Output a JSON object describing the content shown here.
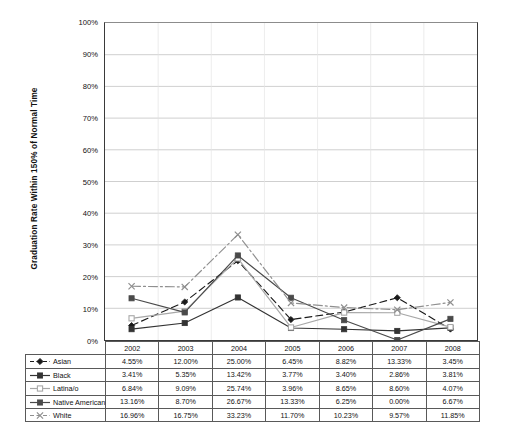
{
  "chart_data": {
    "type": "line",
    "title": "",
    "xlabel": "",
    "ylabel": "Graduation Rate Within 150% of Normal Time",
    "categories": [
      "2002",
      "2003",
      "2004",
      "2005",
      "2006",
      "2007",
      "2008"
    ],
    "ylim": [
      0,
      100
    ],
    "ytick_labels": [
      "0%",
      "10%",
      "20%",
      "30%",
      "40%",
      "50%",
      "60%",
      "70%",
      "80%",
      "90%",
      "100%"
    ],
    "ytick_values": [
      0,
      10,
      20,
      30,
      40,
      50,
      60,
      70,
      80,
      90,
      100
    ],
    "grid": "horizontal",
    "legend_position": "table-left",
    "series": [
      {
        "name": "Asian",
        "values": [
          4.55,
          12.0,
          25.0,
          6.45,
          8.82,
          13.33,
          3.45
        ],
        "labels": [
          "4.55%",
          "12.00%",
          "25.00%",
          "6.45%",
          "8.82%",
          "13.33%",
          "3.45%"
        ],
        "color": "#1a1a1a",
        "dash": "dashed",
        "marker": "diamond"
      },
      {
        "name": "Black",
        "values": [
          3.41,
          5.35,
          13.42,
          3.77,
          3.4,
          2.86,
          3.81
        ],
        "labels": [
          "3.41%",
          "5.35%",
          "13.42%",
          "3.77%",
          "3.40%",
          "2.86%",
          "3.81%"
        ],
        "color": "#333333",
        "dash": "solid",
        "marker": "square"
      },
      {
        "name": "Latina/o",
        "values": [
          6.84,
          9.09,
          25.74,
          3.96,
          8.65,
          8.6,
          4.07
        ],
        "labels": [
          "6.84%",
          "9.09%",
          "25.74%",
          "3.96%",
          "8.65%",
          "8.60%",
          "4.07%"
        ],
        "color": "#a8a8a8",
        "dash": "solid",
        "marker": "square-open"
      },
      {
        "name": "Native American",
        "values": [
          13.16,
          8.7,
          26.67,
          13.33,
          6.25,
          0.0,
          6.67
        ],
        "labels": [
          "13.16%",
          "8.70%",
          "26.67%",
          "13.33%",
          "6.25%",
          "0.00%",
          "6.67%"
        ],
        "color": "#4a4a4a",
        "dash": "solid",
        "marker": "square"
      },
      {
        "name": "White",
        "values": [
          16.96,
          16.75,
          33.23,
          11.7,
          10.23,
          9.57,
          11.85
        ],
        "labels": [
          "16.96%",
          "16.75%",
          "33.23%",
          "11.70%",
          "10.23%",
          "9.57%",
          "11.85%"
        ],
        "color": "#8f8f8f",
        "dash": "dashdot",
        "marker": "cross"
      }
    ]
  },
  "table": {
    "header_corner": "",
    "columns": [
      "2002",
      "2003",
      "2004",
      "2005",
      "2006",
      "2007",
      "2008"
    ],
    "rows": [
      {
        "label": "Asian",
        "cells": [
          "4.55%",
          "12.00%",
          "25.00%",
          "6.45%",
          "8.82%",
          "13.33%",
          "3.45%"
        ]
      },
      {
        "label": "Black",
        "cells": [
          "3.41%",
          "5.35%",
          "13.42%",
          "3.77%",
          "3.40%",
          "2.86%",
          "3.81%"
        ]
      },
      {
        "label": "Latina/o",
        "cells": [
          "6.84%",
          "9.09%",
          "25.74%",
          "3.96%",
          "8.65%",
          "8.60%",
          "4.07%"
        ]
      },
      {
        "label": "Native American",
        "cells": [
          "13.16%",
          "8.70%",
          "26.67%",
          "13.33%",
          "6.25%",
          "0.00%",
          "6.67%"
        ]
      },
      {
        "label": "White",
        "cells": [
          "16.96%",
          "16.75%",
          "33.23%",
          "11.70%",
          "10.23%",
          "9.57%",
          "11.85%"
        ]
      }
    ]
  }
}
